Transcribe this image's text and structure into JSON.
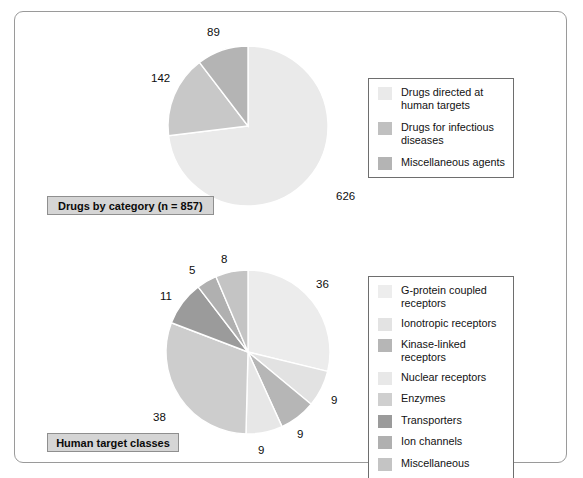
{
  "figure": {
    "width": 583,
    "height": 478,
    "background": "#ffffff",
    "frame_border_color": "#9a9a9a"
  },
  "captions": {
    "top": "Drugs by category (n = 857)",
    "bottom": "Human target classes"
  },
  "chart_data": [
    {
      "type": "pie",
      "title": "Drugs by category (n = 857)",
      "total": 857,
      "start_angle_deg": 0,
      "direction": "clockwise",
      "legend_position": "right",
      "categories": [
        "Drugs directed at human targets",
        "Drugs for infectious diseases",
        "Miscellaneous agents"
      ],
      "values": [
        626,
        142,
        89
      ],
      "data_labels": [
        "626",
        "142",
        "89"
      ],
      "colors": [
        "#eaeaea",
        "#c8c8c8",
        "#b4b4b4"
      ]
    },
    {
      "type": "pie",
      "title": "Human target classes",
      "units": "percent",
      "start_angle_deg": 0,
      "direction": "clockwise",
      "legend_position": "right",
      "categories": [
        "G-protein coupled receptors",
        "Ionotropic receptors",
        "Kinase-linked receptors",
        "Nuclear receptors",
        "Enzymes",
        "Transporters",
        "Ion channels",
        "Miscellaneous"
      ],
      "values": [
        36,
        9,
        9,
        9,
        38,
        11,
        5,
        8
      ],
      "data_labels": [
        "36",
        "9",
        "9",
        "9",
        "38",
        "11",
        "5",
        "8"
      ],
      "colors": [
        "#ececec",
        "#e2e2e2",
        "#b6b6b6",
        "#e7e7e7",
        "#cdcdcd",
        "#9b9b9b",
        "#b0b0b0",
        "#c4c4c4"
      ]
    }
  ],
  "pie1": {
    "center_x": 248,
    "center_y": 126,
    "radius": 80,
    "labels": [
      {
        "text": "626",
        "x": 336,
        "y": 190
      },
      {
        "text": "142",
        "x": 151,
        "y": 72
      },
      {
        "text": "89",
        "x": 207,
        "y": 26
      }
    ]
  },
  "pie2": {
    "center_x": 248,
    "center_y": 352,
    "radius": 82,
    "labels": [
      {
        "text": "36",
        "x": 316,
        "y": 278
      },
      {
        "text": "9",
        "x": 331,
        "y": 394
      },
      {
        "text": "9",
        "x": 297,
        "y": 428
      },
      {
        "text": "9",
        "x": 258,
        "y": 444
      },
      {
        "text": "38",
        "x": 153,
        "y": 411
      },
      {
        "text": "11",
        "x": 160,
        "y": 290
      },
      {
        "text": "5",
        "x": 189,
        "y": 264
      },
      {
        "text": "8",
        "x": 221,
        "y": 253
      }
    ]
  },
  "legend1": {
    "items": [
      {
        "label": "Drugs directed at human targets",
        "color": "#eaeaea"
      },
      {
        "label": "Drugs for infectious diseases",
        "color": "#c0c0c0"
      },
      {
        "label": "Miscellaneous agents",
        "color": "#b4b4b4"
      }
    ]
  },
  "legend2": {
    "items": [
      {
        "label": "G-protein coupled receptors",
        "color": "#ededed"
      },
      {
        "label": "Ionotropic receptors",
        "color": "#e3e3e3"
      },
      {
        "label": "Kinase-linked receptors",
        "color": "#b6b6b6"
      },
      {
        "label": "Nuclear receptors",
        "color": "#e8e8e8"
      },
      {
        "label": "Enzymes",
        "color": "#cfcfcf"
      },
      {
        "label": "Transporters",
        "color": "#9b9b9b"
      },
      {
        "label": "Ion channels",
        "color": "#b0b0b0"
      },
      {
        "label": "Miscellaneous",
        "color": "#c4c4c4"
      }
    ]
  }
}
